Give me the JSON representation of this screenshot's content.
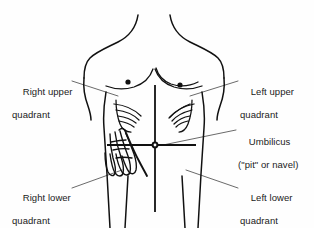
{
  "diagram": {
    "background_color": "#fefefe",
    "ink_color": "#1a1a1a",
    "labels": {
      "right_upper_quadrant": {
        "line1": "Right upper",
        "line2": "quadrant"
      },
      "left_upper_quadrant": {
        "line1": "Left upper",
        "line2": "quadrant"
      },
      "umbilicus": {
        "line1": "Umbilicus",
        "line2": "(\"pit\" or navel)"
      },
      "right_lower_quadrant": {
        "line1": "Right lower",
        "line2": "quadrant"
      },
      "left_lower_quadrant": {
        "line1": "Left lower",
        "line2": "quadrant"
      }
    },
    "features": {
      "torso": "human-torso-outline",
      "nipple_left": "nipple-dot",
      "nipple_right": "nipple-dot",
      "rib_hatching_right": "rib-hatch-marks",
      "rib_hatching_left": "rib-hatch-marks",
      "hand": "palpating-hand",
      "umbilicus_marker": "umbilicus-dot",
      "vertical_divider": "midline-vertical",
      "horizontal_divider": "transumbilical-horizontal"
    }
  }
}
